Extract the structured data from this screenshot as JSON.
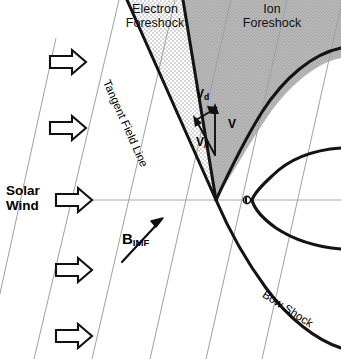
{
  "figure": {
    "kind": "scientific-diagram"
  },
  "labels": {
    "electron_foreshock_line1": "Electron",
    "electron_foreshock_line2": "Foreshock",
    "ion_foreshock_line1": "Ion",
    "ion_foreshock_line2": "Foreshock",
    "solar_wind_line1": "Solar",
    "solar_wind_line2": "Wind",
    "tangent_field_line": "Tangent Field Line",
    "bow_shock": "Bow Shock",
    "b_imf_symbol": "B",
    "b_imf_subscript": "IMF"
  },
  "vectors": {
    "v_drift_symbol": "V",
    "v_drift_subscript": "d",
    "v_total_symbol": "V",
    "v_parallel_symbol": "V",
    "v_parallel_subscript": "//"
  },
  "colors": {
    "ion_foreshock_fill": "#b3b3b3",
    "electron_foreshock_fill": "#ededed",
    "stroke_heavy": "#111111",
    "field_line": "#9a9a9a",
    "sun_earth_line": "#a8a8a8",
    "background": "#ffffff"
  },
  "regions": [
    {
      "name": "electron-foreshock",
      "shading": "stippled-light"
    },
    {
      "name": "ion-foreshock",
      "shading": "solid-gray"
    }
  ],
  "elements": {
    "planet_marker": "obstacle-circle",
    "solar_wind_arrow_count": 5,
    "imf_field_line_count": 6
  }
}
